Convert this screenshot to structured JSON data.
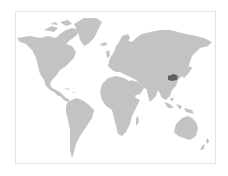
{
  "map": {
    "type": "world-choropleth",
    "land_color": "#c3c3c3",
    "water_color": "#ffffff",
    "border_color": "#e4e4e4",
    "highlight": {
      "region": "Central-East China",
      "color": "#5f5f5f"
    }
  }
}
